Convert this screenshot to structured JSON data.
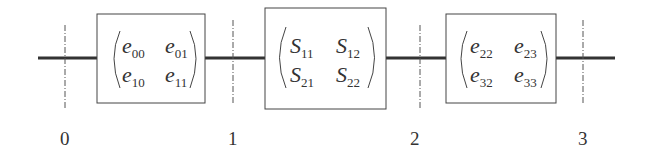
{
  "diagram": {
    "type": "cascaded two-port network",
    "blocks": [
      {
        "name": "error-box-a",
        "letter": "e",
        "cells": [
          [
            "00",
            "01"
          ],
          [
            "10",
            "11"
          ]
        ]
      },
      {
        "name": "dut",
        "letter": "S",
        "cells": [
          [
            "11",
            "12"
          ],
          [
            "21",
            "22"
          ]
        ]
      },
      {
        "name": "error-box-b",
        "letter": "e",
        "cells": [
          [
            "22",
            "23"
          ],
          [
            "32",
            "33"
          ]
        ]
      }
    ],
    "reference_planes": [
      "0",
      "1",
      "2",
      "3"
    ]
  }
}
